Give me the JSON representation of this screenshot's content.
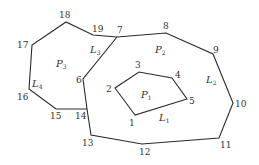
{
  "diagram": {
    "type": "planar-polygon-subdivision",
    "stroke_color": "#2a2a2a",
    "background": "#ffffff",
    "vertices": [
      {
        "id": "1",
        "x": 135,
        "y": 115,
        "lx": 129,
        "ly": 126
      },
      {
        "id": "2",
        "x": 115,
        "y": 88,
        "lx": 106,
        "ly": 92
      },
      {
        "id": "3",
        "x": 139,
        "y": 72,
        "lx": 135,
        "ly": 68
      },
      {
        "id": "4",
        "x": 172,
        "y": 78,
        "lx": 175,
        "ly": 78
      },
      {
        "id": "5",
        "x": 187,
        "y": 99,
        "lx": 189,
        "ly": 104
      },
      {
        "id": "6",
        "x": 83,
        "y": 79,
        "lx": 76,
        "ly": 83
      },
      {
        "id": "7",
        "x": 117,
        "y": 37,
        "lx": 117,
        "ly": 33
      },
      {
        "id": "8",
        "x": 166,
        "y": 33,
        "lx": 163,
        "ly": 29
      },
      {
        "id": "9",
        "x": 213,
        "y": 54,
        "lx": 213,
        "ly": 53
      },
      {
        "id": "10",
        "x": 233,
        "y": 103,
        "lx": 235,
        "ly": 107
      },
      {
        "id": "11",
        "x": 219,
        "y": 138,
        "lx": 220,
        "ly": 148
      },
      {
        "id": "12",
        "x": 142,
        "y": 144,
        "lx": 139,
        "ly": 155
      },
      {
        "id": "13",
        "x": 91,
        "y": 135,
        "lx": 82,
        "ly": 146
      },
      {
        "id": "14",
        "x": 87,
        "y": 109,
        "lx": 75,
        "ly": 119
      },
      {
        "id": "15",
        "x": 56,
        "y": 109,
        "lx": 50,
        "ly": 119
      },
      {
        "id": "16",
        "x": 29,
        "y": 89,
        "lx": 17,
        "ly": 100
      },
      {
        "id": "17",
        "x": 32,
        "y": 45,
        "lx": 17,
        "ly": 48
      },
      {
        "id": "18",
        "x": 66,
        "y": 22,
        "lx": 59,
        "ly": 18
      },
      {
        "id": "19",
        "x": 93,
        "y": 35,
        "lx": 92,
        "ly": 32
      }
    ],
    "polylines": [
      {
        "name": "inner-polygon-L1",
        "closed": true,
        "points": [
          "1",
          "2",
          "3",
          "4",
          "5"
        ]
      },
      {
        "name": "outer-boundary-L2",
        "closed": false,
        "points": [
          "7",
          "8",
          "9",
          "10",
          "11",
          "12",
          "13",
          "14"
        ]
      },
      {
        "name": "divider-L3",
        "closed": false,
        "points": [
          "7",
          "6",
          "14"
        ]
      },
      {
        "name": "left-polygon-L4",
        "closed": false,
        "points": [
          "14",
          "15",
          "16",
          "17",
          "18",
          "19",
          "7"
        ]
      }
    ],
    "regions": [
      {
        "name": "P",
        "sub": "1",
        "x": 141,
        "y": 98
      },
      {
        "name": "P",
        "sub": "2",
        "x": 155,
        "y": 53
      },
      {
        "name": "P",
        "sub": "3",
        "x": 56,
        "y": 67
      }
    ],
    "curve_labels": [
      {
        "name": "L",
        "sub": "1",
        "x": 159,
        "y": 121
      },
      {
        "name": "L",
        "sub": "2",
        "x": 206,
        "y": 83
      },
      {
        "name": "L",
        "sub": "3",
        "x": 90,
        "y": 53
      },
      {
        "name": "L",
        "sub": "4",
        "x": 32,
        "y": 87
      }
    ]
  }
}
